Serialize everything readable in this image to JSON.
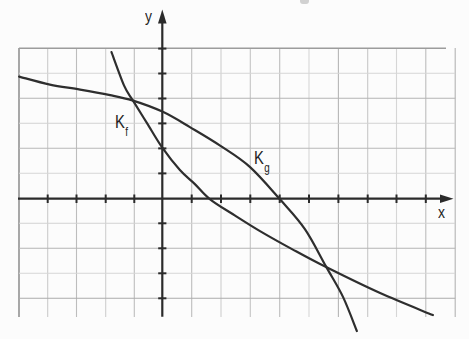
{
  "figure": {
    "axis_labels": {
      "x": "x",
      "y": "y"
    },
    "curves": {
      "f": {
        "label_main": "K",
        "label_sub": "f"
      },
      "g": {
        "label_main": "K",
        "label_sub": "g"
      }
    },
    "colors": {
      "ink": "#2e2e2e",
      "axis": "#2b2b2b",
      "grid_light": "#d3d3d3",
      "grid_dark": "#b2b2b2",
      "grid_border": "#929292",
      "paper": "#fcfcfc"
    }
  },
  "chart_data": {
    "type": "line",
    "title": "",
    "xlabel": "x",
    "ylabel": "y",
    "xlim": [
      -5,
      10
    ],
    "ylim": [
      -5.5,
      6.5
    ],
    "grid": true,
    "tick_step": {
      "x": 1,
      "y": 1
    },
    "tick_labels_shown": false,
    "legend_position": "inline-curve-labels",
    "series": [
      {
        "name": "Kf",
        "points": [
          [
            -1.73,
            5.86
          ],
          [
            -1.3,
            4.52
          ],
          [
            -1.0,
            3.92
          ],
          [
            -0.52,
            3.02
          ],
          [
            0,
            2.04
          ],
          [
            0.6,
            1.14
          ],
          [
            1.11,
            0.58
          ],
          [
            1.63,
            -0.03
          ],
          [
            2.48,
            -0.68
          ],
          [
            3.33,
            -1.3
          ],
          [
            4.42,
            -2.02
          ],
          [
            5.58,
            -2.74
          ],
          [
            7.42,
            -3.78
          ],
          [
            9.22,
            -4.66
          ]
        ]
      },
      {
        "name": "Kg",
        "points": [
          [
            -4.88,
            4.88
          ],
          [
            -3.83,
            4.56
          ],
          [
            -2.8,
            4.36
          ],
          [
            -1.78,
            4.14
          ],
          [
            -1.0,
            3.92
          ],
          [
            0,
            3.48
          ],
          [
            0.94,
            2.86
          ],
          [
            1.97,
            2.12
          ],
          [
            2.99,
            1.26
          ],
          [
            4.01,
            -0.03
          ],
          [
            4.86,
            -1.22
          ],
          [
            5.58,
            -2.72
          ],
          [
            6.16,
            -3.94
          ],
          [
            6.63,
            -5.3
          ]
        ]
      }
    ],
    "intersections": [
      [
        -1.0,
        3.92
      ],
      [
        5.58,
        -2.73
      ]
    ]
  },
  "geometry": {
    "origin_px": [
      162.3,
      198.6
    ],
    "unit_px": [
      29.35,
      25
    ]
  }
}
